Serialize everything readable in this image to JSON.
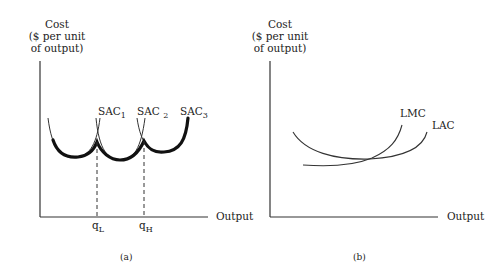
{
  "panels": [
    {
      "id": "a",
      "caption": "(a)",
      "y_axis_label": [
        "Cost",
        "($ per unit",
        "of output)"
      ],
      "x_axis_label": "Output",
      "curves": [
        {
          "name": "SAC",
          "sub": "1"
        },
        {
          "name": "SAC",
          "sub": "2"
        },
        {
          "name": "SAC",
          "sub": "3"
        }
      ],
      "x_ticks": [
        {
          "name": "q",
          "sub": "L"
        },
        {
          "name": "q",
          "sub": "H"
        }
      ]
    },
    {
      "id": "b",
      "caption": "(b)",
      "y_axis_label": [
        "Cost",
        "($ per unit",
        "of output)"
      ],
      "x_axis_label": "Output",
      "curves": [
        {
          "name": "LMC"
        },
        {
          "name": "LAC"
        }
      ]
    }
  ],
  "colors": {
    "line": "#222222",
    "background": "#ffffff"
  }
}
